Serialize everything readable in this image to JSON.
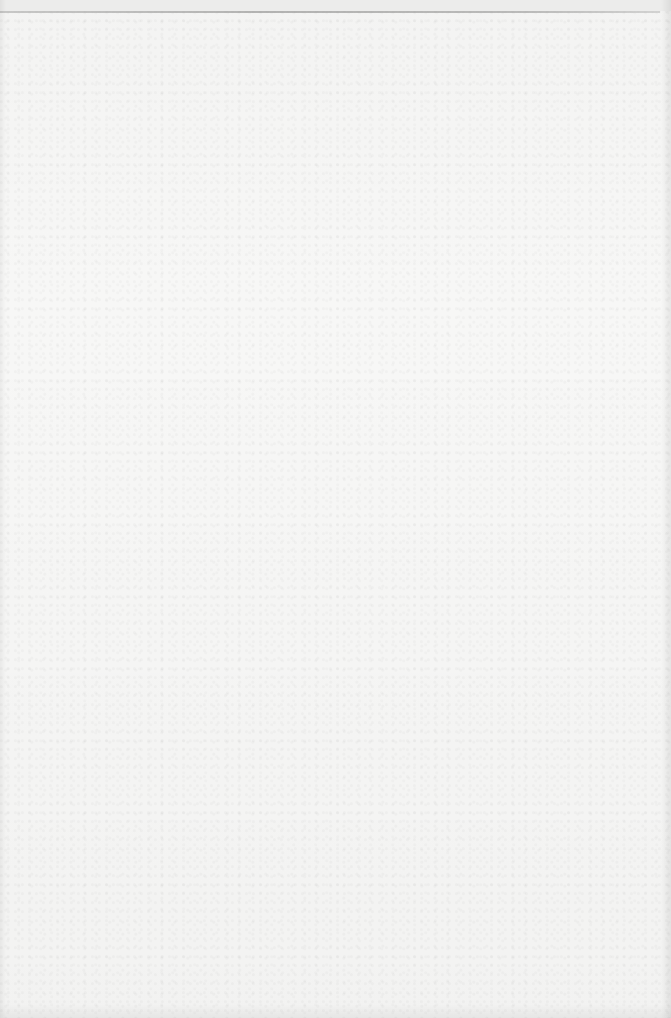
{
  "document": {
    "type": "scanned-page",
    "text": "",
    "colors": {
      "paper": "#f7f7f6",
      "top_edge_line": "#a8a8a7"
    }
  }
}
